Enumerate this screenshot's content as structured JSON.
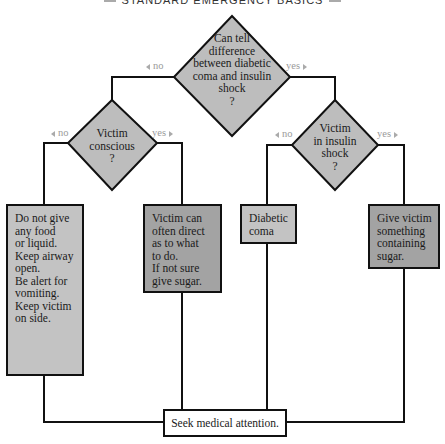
{
  "header": {
    "title_fragment": "STANDARD EMERGENCY BASICS"
  },
  "decisions": {
    "top": {
      "lines": [
        "Can tell",
        "difference",
        "between diabetic",
        "coma and insulin",
        "shock",
        "?"
      ],
      "no_label": "no",
      "yes_label": "yes"
    },
    "conscious": {
      "lines": [
        "Victim",
        "conscious",
        "?"
      ],
      "no_label": "no",
      "yes_label": "yes"
    },
    "insulin_shock": {
      "lines": [
        "Victim",
        "in insulin",
        "shock",
        "?"
      ],
      "no_label": "no",
      "yes_label": "yes"
    }
  },
  "actions": {
    "unconscious": {
      "lines": [
        "Do not give",
        " any food",
        " or liquid.",
        "Keep airway",
        " open.",
        "Be alert for",
        " vomiting.",
        "Keep victim",
        " on side."
      ]
    },
    "conscious": {
      "lines": [
        "Victim can",
        " often direct",
        " as to what",
        " to do.",
        "If not sure",
        " give sugar."
      ]
    },
    "diabetic_coma": {
      "lines": [
        "Diabetic",
        "coma"
      ]
    },
    "insulin_shock": {
      "lines": [
        "Give victim",
        "something",
        "containing",
        "sugar."
      ]
    },
    "final": {
      "label": "Seek medical attention."
    }
  },
  "colors": {
    "diamond_fill": "#bdbdbd",
    "box_light": "#c3c3c3",
    "box_dark": "#a3a3a3",
    "line": "#111111",
    "branch_label": "#9a9a9a"
  }
}
